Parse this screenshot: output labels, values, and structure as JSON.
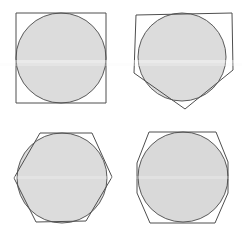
{
  "figure": {
    "background_color": "#ffffff",
    "stroke_color": "#5a5a5a",
    "polygon_stroke_color": "#4e4e4e",
    "fill_color": "#dcdcdc",
    "fill_color_secondary": "#d9d9d9",
    "stroke_width": 1,
    "canvas": {
      "width": 242,
      "height": 235
    },
    "panel_count": 4,
    "panels": [
      {
        "id": "panel-square",
        "position": "top-left",
        "circle": {
          "cx": 61,
          "cy": 58,
          "r": 45
        },
        "polygon": {
          "name": "square",
          "sides": 4,
          "rotation_deg": 0,
          "circumradius": 63.6,
          "points": "16,13 106,13 106,103 16,103"
        }
      },
      {
        "id": "panel-pentagon",
        "position": "top-right",
        "circle": {
          "cx": 182,
          "cy": 57,
          "r": 44
        },
        "polygon": {
          "name": "pentagon",
          "sides": 5,
          "rotation_deg": 184,
          "circumradius": 54,
          "points": "185,109 134,73 136,15 232,13 233,70"
        }
      },
      {
        "id": "panel-hexagon",
        "position": "bottom-left",
        "circle": {
          "cx": 62,
          "cy": 178,
          "r": 45
        },
        "polygon": {
          "name": "hexagon",
          "sides": 6,
          "rotation_deg": 0,
          "circumradius": 52,
          "points": "14,178 40,133 92,133 112,177 86,221 36,222"
        }
      },
      {
        "id": "panel-octagon",
        "position": "bottom-right",
        "circle": {
          "cx": 183,
          "cy": 177,
          "r": 45
        },
        "polygon": {
          "name": "octagon",
          "sides": 8,
          "rotation_deg": 22.5,
          "circumradius": 49,
          "points": "149,132 216,132 228,162 228,193 215,223 150,223 137,193 137,163"
        }
      }
    ]
  }
}
